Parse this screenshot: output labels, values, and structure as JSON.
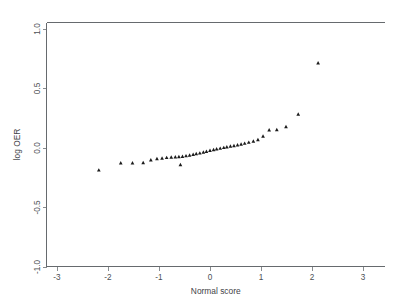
{
  "chart_data": {
    "type": "scatter",
    "title": "",
    "xlabel": "Normal score",
    "ylabel": "log OER",
    "xlim": [
      -3.4,
      3.4
    ],
    "ylim": [
      -1.12,
      1.08
    ],
    "xticks": [
      -3,
      -2,
      -1,
      0,
      1,
      2,
      3
    ],
    "xticklabels": [
      "-3",
      "-2",
      "-1",
      "0",
      "1",
      "2",
      "3"
    ],
    "yticks": [
      -1.0,
      -0.5,
      0.0,
      0.5,
      1.0
    ],
    "yticklabels": [
      "-1.0",
      "-0.5",
      "0.0",
      "0.5",
      "1.0"
    ],
    "grid": false,
    "legend": null,
    "marker": "triangle-point",
    "marker_color": "#1b1b1b",
    "frame": "top-and-bottom-only",
    "points": [
      {
        "x": -2.18,
        "y": -0.185
      },
      {
        "x": -1.75,
        "y": -0.125
      },
      {
        "x": -1.52,
        "y": -0.125
      },
      {
        "x": -1.31,
        "y": -0.123
      },
      {
        "x": -1.16,
        "y": -0.1
      },
      {
        "x": -1.04,
        "y": -0.09
      },
      {
        "x": -0.94,
        "y": -0.085
      },
      {
        "x": -0.85,
        "y": -0.08
      },
      {
        "x": -0.76,
        "y": -0.077
      },
      {
        "x": -0.68,
        "y": -0.074
      },
      {
        "x": -0.61,
        "y": -0.072
      },
      {
        "x": -0.58,
        "y": -0.14
      },
      {
        "x": -0.54,
        "y": -0.07
      },
      {
        "x": -0.47,
        "y": -0.065
      },
      {
        "x": -0.4,
        "y": -0.06
      },
      {
        "x": -0.33,
        "y": -0.054
      },
      {
        "x": -0.27,
        "y": -0.048
      },
      {
        "x": -0.2,
        "y": -0.042
      },
      {
        "x": -0.13,
        "y": -0.035
      },
      {
        "x": -0.07,
        "y": -0.028
      },
      {
        "x": 0.0,
        "y": -0.02
      },
      {
        "x": 0.07,
        "y": -0.014
      },
      {
        "x": 0.13,
        "y": -0.008
      },
      {
        "x": 0.2,
        "y": -0.002
      },
      {
        "x": 0.27,
        "y": 0.004
      },
      {
        "x": 0.33,
        "y": 0.01
      },
      {
        "x": 0.4,
        "y": 0.015
      },
      {
        "x": 0.47,
        "y": 0.02
      },
      {
        "x": 0.54,
        "y": 0.026
      },
      {
        "x": 0.61,
        "y": 0.032
      },
      {
        "x": 0.68,
        "y": 0.04
      },
      {
        "x": 0.76,
        "y": 0.048
      },
      {
        "x": 0.85,
        "y": 0.058
      },
      {
        "x": 0.94,
        "y": 0.07
      },
      {
        "x": 1.04,
        "y": 0.1
      },
      {
        "x": 1.16,
        "y": 0.152
      },
      {
        "x": 1.31,
        "y": 0.155
      },
      {
        "x": 1.49,
        "y": 0.18
      },
      {
        "x": 1.73,
        "y": 0.285
      },
      {
        "x": 2.12,
        "y": 0.715
      }
    ]
  },
  "axes": {
    "x_title": "Normal score",
    "y_title": "log OER"
  }
}
